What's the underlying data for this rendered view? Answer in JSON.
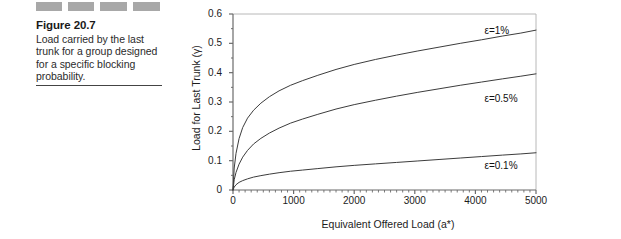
{
  "figure": {
    "redaction_blocks": [
      "",
      "",
      "",
      ""
    ],
    "title": "Figure 20.7",
    "caption": "Load carried by the last trunk for a group designed for a specific blocking probability."
  },
  "chart_data": {
    "type": "line",
    "title": "",
    "xlabel": "Equivalent Offered Load (a*)",
    "ylabel": "Load for Last Trunk (γ)",
    "xlim": [
      0,
      5000
    ],
    "ylim": [
      0,
      0.6
    ],
    "xticks": [
      0,
      1000,
      2000,
      3000,
      4000,
      5000
    ],
    "xtick_labels": [
      "0",
      "1000",
      "2000",
      "3000",
      "4000",
      "5000"
    ],
    "yticks": [
      0,
      0.1,
      0.2,
      0.3,
      0.4,
      0.5,
      0.6
    ],
    "ytick_labels": [
      "0",
      "0.1",
      "0.2",
      "0.3",
      "0.4",
      "0.5",
      "0.6"
    ],
    "grid": false,
    "legend_position": "inline-right",
    "series": [
      {
        "name": "ε=1%",
        "label_x": 4150,
        "label_y": 0.545,
        "x": [
          0,
          20,
          50,
          100,
          160,
          240,
          340,
          460,
          600,
          760,
          950,
          1150,
          1400,
          1700,
          2000,
          2350,
          2700,
          3050,
          3400,
          3750,
          4100,
          4450,
          4750,
          5000
        ],
        "y": [
          0.0,
          0.075,
          0.125,
          0.175,
          0.213,
          0.245,
          0.272,
          0.296,
          0.318,
          0.338,
          0.357,
          0.373,
          0.391,
          0.411,
          0.428,
          0.445,
          0.46,
          0.474,
          0.487,
          0.5,
          0.512,
          0.525,
          0.535,
          0.545
        ]
      },
      {
        "name": "ε=0.5%",
        "label_x": 4150,
        "label_y": 0.315,
        "x": [
          0,
          20,
          50,
          100,
          160,
          240,
          340,
          460,
          600,
          760,
          950,
          1150,
          1400,
          1700,
          2000,
          2350,
          2700,
          3050,
          3400,
          3750,
          4100,
          4450,
          4750,
          5000
        ],
        "y": [
          0.0,
          0.035,
          0.06,
          0.088,
          0.112,
          0.135,
          0.157,
          0.176,
          0.194,
          0.211,
          0.228,
          0.242,
          0.258,
          0.276,
          0.291,
          0.306,
          0.32,
          0.333,
          0.345,
          0.357,
          0.368,
          0.379,
          0.388,
          0.396
        ]
      },
      {
        "name": "ε=0.1%",
        "label_x": 4150,
        "label_y": 0.085,
        "x": [
          0,
          20,
          50,
          100,
          160,
          240,
          340,
          460,
          600,
          760,
          950,
          1150,
          1400,
          1700,
          2000,
          2350,
          2700,
          3050,
          3400,
          3750,
          4100,
          4450,
          4750,
          5000
        ],
        "y": [
          0.0,
          0.01,
          0.018,
          0.026,
          0.032,
          0.038,
          0.044,
          0.049,
          0.054,
          0.059,
          0.064,
          0.068,
          0.073,
          0.079,
          0.084,
          0.089,
          0.094,
          0.099,
          0.104,
          0.109,
          0.114,
          0.119,
          0.123,
          0.127
        ]
      }
    ]
  },
  "colors": {
    "curve": "#3c3c3c",
    "axis": "#6b6b6b",
    "frame": "#b8b8b8",
    "text": "#1c1c1c"
  }
}
